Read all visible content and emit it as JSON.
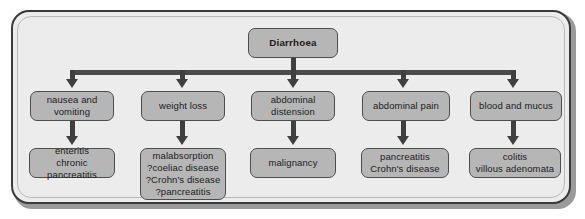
{
  "diagram": {
    "title": "Diarrhoea",
    "type": "flowchart",
    "root": {
      "label": "Diarrhoea"
    },
    "branches": [
      {
        "symptom": "nausea and\nvomiting",
        "diagnosis": "enteritis\nchronic pancreatitis"
      },
      {
        "symptom": "weight loss",
        "diagnosis": "malabsorption\n?coeliac disease\n?Crohn's disease\n?pancreatitis"
      },
      {
        "symptom": "abdominal\ndistension",
        "diagnosis": "malignancy"
      },
      {
        "symptom": "abdominal pain",
        "diagnosis": "pancreatitis\nCrohn's disease"
      },
      {
        "symptom": "blood and mucus",
        "diagnosis": "colitis\nvillous adenomata"
      }
    ],
    "colors": {
      "node_fill": "#b6b6b6",
      "node_border": "#4d4d4d",
      "frame_fill": "#ececec",
      "frame_border": "#3a3a3a",
      "connector": "#3f3f3f"
    }
  }
}
